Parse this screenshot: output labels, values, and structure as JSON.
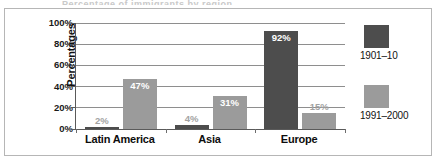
{
  "figure": {
    "title_sliver": "Percentage of immigrants by region",
    "frame_color": "#b6b6b6",
    "background": "#ffffff"
  },
  "chart_data": {
    "type": "bar",
    "title": "",
    "xlabel": "",
    "ylabel": "Percentages",
    "ylim": [
      0,
      100
    ],
    "yticks": [
      0,
      20,
      40,
      60,
      80,
      100
    ],
    "ytick_labels": [
      "0%",
      "20%",
      "40%",
      "60%",
      "80%",
      "100%"
    ],
    "grid": true,
    "legend_position": "right",
    "categories": [
      "Latin America",
      "Asia",
      "Europe"
    ],
    "series": [
      {
        "name": "1901–10",
        "color": "#4d4d4d",
        "values": [
          2,
          4,
          92
        ],
        "labels": [
          "2%",
          "4%",
          "92%"
        ]
      },
      {
        "name": "1991–2000",
        "color": "#9b9b9b",
        "values": [
          47,
          31,
          15
        ],
        "labels": [
          "47%",
          "31%",
          "15%"
        ]
      }
    ]
  }
}
